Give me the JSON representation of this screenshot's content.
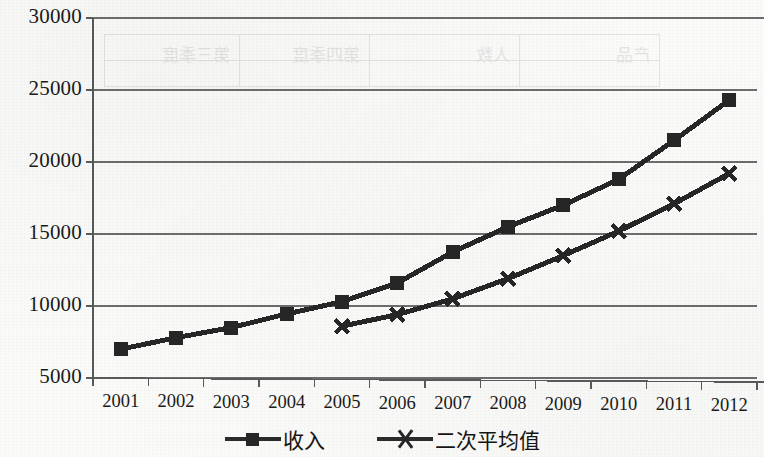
{
  "chart_data": {
    "type": "line",
    "title": "",
    "subtitle": "",
    "xlabel": "",
    "ylabel": "",
    "categories": [
      "2001",
      "2002",
      "2003",
      "2004",
      "2005",
      "2006",
      "2007",
      "2008",
      "2009",
      "2010",
      "2011",
      "2012"
    ],
    "ylim": [
      5000,
      30000
    ],
    "ytick_values": [
      5000,
      10000,
      15000,
      20000,
      25000,
      30000
    ],
    "ytick_labels": [
      "5000",
      "10000",
      "15000",
      "20000",
      "25000",
      "30000"
    ],
    "grid": true,
    "grid_axis": "y",
    "legend_position": "bottom",
    "series": [
      {
        "name": "收入",
        "marker": "square",
        "color": "#262626",
        "x": [
          "2001",
          "2002",
          "2003",
          "2004",
          "2005",
          "2006",
          "2007",
          "2008",
          "2009",
          "2010",
          "2011",
          "2012"
        ],
        "values": [
          7000,
          7800,
          8500,
          9450,
          10300,
          11600,
          13750,
          15500,
          17000,
          18800,
          21500,
          24300
        ]
      },
      {
        "name": "二次平均值",
        "marker": "x",
        "color": "#262626",
        "x": [
          "2005",
          "2006",
          "2007",
          "2008",
          "2009",
          "2010",
          "2011",
          "2012"
        ],
        "values": [
          8600,
          9400,
          10500,
          11900,
          13500,
          15200,
          17100,
          19200
        ]
      }
    ]
  },
  "legend": {
    "items": [
      {
        "label": "收入",
        "marker": "square"
      },
      {
        "label": "二次平均值",
        "marker": "x"
      }
    ]
  },
  "bleed_through": {
    "note": "faint mirrored show-through of a table printed on the reverse of the scanned page",
    "cells": [
      "产品",
      "人数",
      "第四季度",
      "第三季度"
    ]
  },
  "colors": {
    "ink": "#262626",
    "gridline": "#6d6d6d",
    "axis": "#5a5a5a",
    "paper": "#fbfbf9"
  }
}
